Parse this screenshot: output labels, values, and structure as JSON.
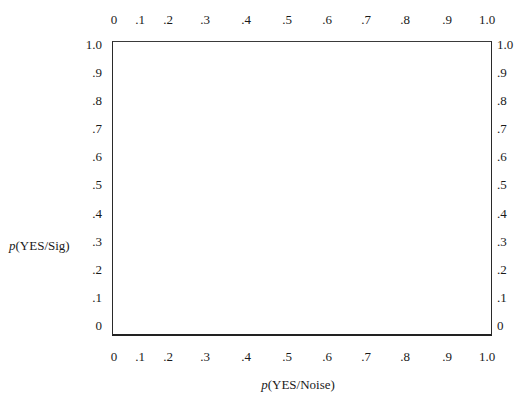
{
  "chart_data": {
    "type": "scatter",
    "title": "",
    "xlabel_prefix": "p",
    "xlabel_rest": "(YES/Noise)",
    "ylabel_prefix": "p",
    "ylabel_rest": "(YES/Sig)",
    "xlim": [
      0,
      1.0
    ],
    "ylim": [
      0,
      1.0
    ],
    "grid": false,
    "series": [],
    "x_ticks": [
      "0",
      ".1",
      ".2",
      ".3",
      ".4",
      ".5",
      ".6",
      ".7",
      ".8",
      ".9",
      "1.0"
    ],
    "y_ticks": [
      "1.0",
      ".9",
      ".8",
      ".7",
      ".6",
      ".5",
      ".4",
      ".3",
      ".2",
      ".1",
      "0"
    ],
    "tick_labels_on": [
      "top",
      "bottom",
      "left",
      "right"
    ],
    "note": "Empty ROC-space plotting frame; no data points drawn."
  },
  "layout": {
    "x_tick_positions": [
      114,
      140,
      168,
      205,
      246,
      287,
      327,
      366,
      405,
      447,
      487
    ],
    "y_tick_positions": [
      45,
      73,
      101,
      129,
      157,
      185,
      214,
      242,
      270,
      298,
      326
    ]
  }
}
